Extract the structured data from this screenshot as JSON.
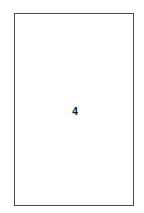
{
  "page": {
    "number": "4",
    "border_color": "#4a4a4a",
    "background": "#ffffff"
  }
}
